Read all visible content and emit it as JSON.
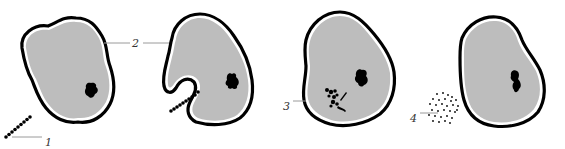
{
  "diagram": {
    "type": "sequence-of-cells",
    "panels": [
      {
        "index": 1,
        "description": "cell approaching bead-chain particle",
        "label": "1",
        "label_target": "particle-chain"
      },
      {
        "index": 2,
        "description": "cell membrane invaginating around bead-chain particle",
        "label": "2",
        "label_target": "cell-membrane"
      },
      {
        "index": 3,
        "description": "particle engulfed and fragmenting inside cell",
        "label": "3",
        "label_target": "internalized-fragments"
      },
      {
        "index": 4,
        "description": "fragments released outside cell as scattered dots",
        "label": "4",
        "label_target": "released-debris"
      }
    ],
    "labels": [
      "1",
      "2",
      "3",
      "4"
    ],
    "colors": {
      "membrane": "#000000",
      "cytoplasm": "#bdbdbd",
      "nucleus": "#000000",
      "leader_line": "#9a9a9a",
      "background": "#ffffff"
    }
  }
}
